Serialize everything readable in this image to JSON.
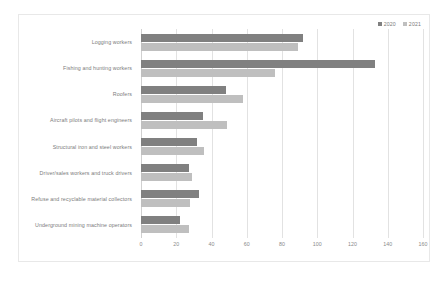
{
  "chart_data": {
    "type": "bar",
    "orientation": "horizontal",
    "title": "",
    "xlabel": "",
    "ylabel": "",
    "xlim": [
      0,
      160
    ],
    "xticks": [
      0,
      20,
      40,
      60,
      80,
      100,
      120,
      140,
      160
    ],
    "grid": true,
    "legend_position": "top-right",
    "categories": [
      "Logging workers",
      "Fishing and hunting workers",
      "Roofers",
      "Aircraft pilots and flight engineers",
      "Structural iron and steel workers",
      "Driver/sales workers and truck drivers",
      "Refuse and recyclable material collectors",
      "Underground mining machine operators"
    ],
    "series": [
      {
        "name": "2020",
        "color": "#808080",
        "values": [
          92,
          133,
          48,
          35,
          32,
          27,
          33,
          22
        ]
      },
      {
        "name": "2021",
        "color": "#bfbfbf",
        "values": [
          89,
          76,
          58,
          49,
          36,
          29,
          28,
          27
        ]
      }
    ]
  },
  "colors": {
    "series_2020": "#808080",
    "series_2021": "#bfbfbf",
    "gridline": "#e2e2e2",
    "axis": "#d0d0d0",
    "text": "#7b7b7b",
    "frame_border": "#e8e8e8"
  }
}
